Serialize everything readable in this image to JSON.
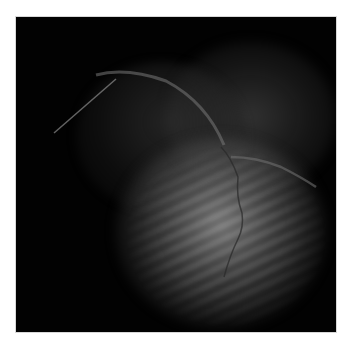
{
  "image": {
    "description": "Grayscale coronary angiogram (X-ray fluoroscopy) showing heart silhouette with contrast-filled vessels and a catheter",
    "colors": {
      "background": "#020202",
      "border": "#d8d8d8",
      "page": "#ffffff"
    }
  }
}
